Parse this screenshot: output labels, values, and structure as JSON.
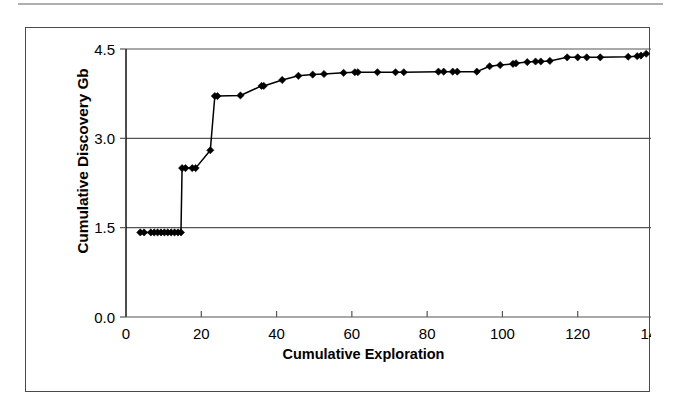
{
  "figure": {
    "frame_border_color": "#4a4a4a",
    "background": "#ffffff",
    "top_rule_color": "#b0b0b0"
  },
  "chart_data": {
    "type": "line",
    "title": "",
    "subtitle": "",
    "xlabel": "Cumulative Exploration",
    "ylabel": "Cumulative Discovery Gb",
    "xlim": [
      0,
      140
    ],
    "ylim": [
      0.0,
      4.5
    ],
    "xticks": [
      0,
      20,
      40,
      60,
      80,
      100,
      120,
      140
    ],
    "xtick_labels": [
      "0",
      "20",
      "40",
      "60",
      "80",
      "100",
      "120",
      "140"
    ],
    "yticks": [
      0.0,
      1.5,
      3.0,
      4.5
    ],
    "ytick_labels": [
      "0.0",
      "1.5",
      "3.0",
      "4.5"
    ],
    "grid": "horizontal",
    "gridlines_y": [
      1.5,
      3.0,
      4.5
    ],
    "legend": "none",
    "marker": "diamond",
    "marker_color": "#000000",
    "line_color": "#000000",
    "series": [
      {
        "name": "Cumulative Discovery",
        "points": [
          [
            3.8,
            1.42
          ],
          [
            4.8,
            1.42
          ],
          [
            6.6,
            1.42
          ],
          [
            7.5,
            1.42
          ],
          [
            8.4,
            1.42
          ],
          [
            9.3,
            1.42
          ],
          [
            10.2,
            1.42
          ],
          [
            11.1,
            1.42
          ],
          [
            12.0,
            1.42
          ],
          [
            12.9,
            1.42
          ],
          [
            13.8,
            1.42
          ],
          [
            14.6,
            1.42
          ],
          [
            14.9,
            2.5
          ],
          [
            15.8,
            2.5
          ],
          [
            17.6,
            2.5
          ],
          [
            18.5,
            2.5
          ],
          [
            22.4,
            2.8
          ],
          [
            23.6,
            3.71
          ],
          [
            24.3,
            3.71
          ],
          [
            30.4,
            3.72
          ],
          [
            36.0,
            3.88
          ],
          [
            36.6,
            3.88
          ],
          [
            41.5,
            3.98
          ],
          [
            45.8,
            4.05
          ],
          [
            49.6,
            4.07
          ],
          [
            52.6,
            4.08
          ],
          [
            57.8,
            4.1
          ],
          [
            60.8,
            4.11
          ],
          [
            61.6,
            4.11
          ],
          [
            66.8,
            4.11
          ],
          [
            71.6,
            4.11
          ],
          [
            73.8,
            4.11
          ],
          [
            83.0,
            4.12
          ],
          [
            84.4,
            4.12
          ],
          [
            86.8,
            4.12
          ],
          [
            88.0,
            4.12
          ],
          [
            93.2,
            4.12
          ],
          [
            96.6,
            4.21
          ],
          [
            99.4,
            4.23
          ],
          [
            102.8,
            4.25
          ],
          [
            103.6,
            4.26
          ],
          [
            106.6,
            4.28
          ],
          [
            108.8,
            4.29
          ],
          [
            110.2,
            4.29
          ],
          [
            112.6,
            4.3
          ],
          [
            117.2,
            4.36
          ],
          [
            120.0,
            4.36
          ],
          [
            122.4,
            4.36
          ],
          [
            126.0,
            4.36
          ],
          [
            133.4,
            4.37
          ],
          [
            135.8,
            4.38
          ],
          [
            136.8,
            4.39
          ],
          [
            138.2,
            4.42
          ]
        ]
      }
    ]
  }
}
